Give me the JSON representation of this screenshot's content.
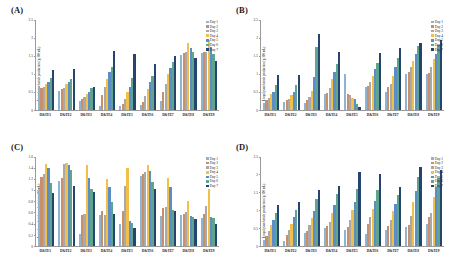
{
  "figure": {
    "panels": [
      "A",
      "B",
      "C",
      "D"
    ]
  },
  "legend": {
    "colors": [
      "#8eb4d4",
      "#c98f6a",
      "#a9a9a9",
      "#f0c04a",
      "#5b8ec4",
      "#5fa48f",
      "#26456e"
    ],
    "items": [
      {
        "label": "Day 1"
      },
      {
        "label": "Day 2"
      },
      {
        "label": "Day 3"
      },
      {
        "label": "Day 4"
      },
      {
        "label": "Day 5"
      },
      {
        "label": "Day 6"
      },
      {
        "label": "Day 7"
      }
    ]
  },
  "chart_data": [
    {
      "panel": "A",
      "type": "bar",
      "title": "(A)",
      "xlabel": "",
      "ylabel": "Exopolysaccharide production (g/100 mL)",
      "ylim": [
        0,
        2.5
      ],
      "yticks": [
        0,
        0.5,
        1,
        1.5,
        2,
        2.5
      ],
      "ytick_labels": [
        "0",
        "0.5",
        "1",
        "1.5",
        "2",
        "2.5"
      ],
      "grid": false,
      "legend_position": "top-right",
      "categories": [
        "D&TE1",
        "D&TE2",
        "D&TE3",
        "D&TE4",
        "D&TE5",
        "D&TE6",
        "D&TE7",
        "D&TE8",
        "D&TE9"
      ],
      "series": [
        {
          "name": "Day 1",
          "values": [
            0.56,
            0.52,
            0.25,
            0.1,
            0.1,
            0.12,
            0.25,
            1.52,
            1.58
          ]
        },
        {
          "name": "Day 2",
          "values": [
            0.6,
            0.56,
            0.3,
            0.4,
            0.15,
            0.2,
            0.5,
            1.58,
            1.6
          ]
        },
        {
          "name": "Day 3",
          "values": [
            0.64,
            0.6,
            0.36,
            0.62,
            0.3,
            0.38,
            0.72,
            1.62,
            1.62
          ]
        },
        {
          "name": "Day 4",
          "values": [
            0.7,
            0.7,
            0.42,
            0.86,
            0.5,
            0.58,
            0.98,
            1.87,
            1.93
          ]
        },
        {
          "name": "Day 5",
          "values": [
            0.78,
            0.76,
            0.5,
            1.05,
            0.62,
            0.76,
            1.15,
            1.72,
            1.74
          ]
        },
        {
          "name": "Day 6",
          "values": [
            0.88,
            0.86,
            0.6,
            1.18,
            0.88,
            0.94,
            1.33,
            1.6,
            1.56
          ]
        },
        {
          "name": "Day 7",
          "values": [
            1.11,
            1.14,
            0.64,
            1.64,
            1.55,
            1.28,
            1.5,
            1.44,
            1.36
          ]
        }
      ]
    },
    {
      "panel": "B",
      "type": "bar",
      "title": "(B)",
      "xlabel": "",
      "ylabel": "Exopolysaccharide production (g/100 mL)",
      "ylim": [
        0,
        2.5
      ],
      "yticks": [
        0,
        0.5,
        1,
        1.5,
        2,
        2.5
      ],
      "ytick_labels": [
        "0",
        "0.5",
        "1",
        "1.5",
        "2",
        "2.5"
      ],
      "grid": false,
      "legend_position": "top-right",
      "categories": [
        "D&TE1",
        "D&TE2",
        "D&TE3",
        "D&TE4",
        "D&TE5",
        "D&TE6",
        "D&TE7",
        "D&TE8",
        "D&TE9"
      ],
      "series": [
        {
          "name": "Day 1",
          "values": [
            0.18,
            0.2,
            0.17,
            0.42,
            0.98,
            0.62,
            0.5,
            0.98,
            0.98
          ]
        },
        {
          "name": "Day 2",
          "values": [
            0.26,
            0.26,
            0.26,
            0.46,
            0.44,
            0.66,
            0.62,
            1.06,
            1.02
          ]
        },
        {
          "name": "Day 3",
          "values": [
            0.32,
            0.3,
            0.36,
            0.6,
            0.4,
            0.78,
            0.72,
            1.2,
            1.18
          ]
        },
        {
          "name": "Day 4",
          "values": [
            0.44,
            0.4,
            0.52,
            0.86,
            0.33,
            0.94,
            0.95,
            1.36,
            1.4
          ]
        },
        {
          "name": "Day 5",
          "values": [
            0.5,
            0.5,
            0.9,
            1.06,
            0.28,
            1.12,
            1.2,
            1.56,
            1.56
          ]
        },
        {
          "name": "Day 6",
          "values": [
            0.68,
            0.68,
            1.76,
            1.28,
            0.15,
            1.3,
            1.44,
            1.78,
            1.8
          ]
        },
        {
          "name": "Day 7",
          "values": [
            0.97,
            0.97,
            2.12,
            1.62,
            0.07,
            1.58,
            1.72,
            1.86,
            1.95
          ]
        }
      ]
    },
    {
      "panel": "C",
      "type": "bar",
      "title": "(C)",
      "xlabel": "",
      "ylabel": "Exopolysaccharide production (g/100 mL)",
      "ylim": [
        0,
        1.6
      ],
      "yticks": [
        0,
        0.2,
        0.4,
        0.6,
        0.8,
        1,
        1.2,
        1.4,
        1.6
      ],
      "ytick_labels": [
        "0",
        "0.2",
        "0.4",
        "0.6",
        "0.8",
        "1",
        "1.2",
        "1.4",
        "1.6"
      ],
      "grid": false,
      "legend_position": "top-right",
      "categories": [
        "D&TE1",
        "D&TE2",
        "D&TE3",
        "D&TE4",
        "D&TE5",
        "D&TE6",
        "D&TE7",
        "D&TE8",
        "D&TE9"
      ],
      "series": [
        {
          "name": "Day 1",
          "values": [
            1.02,
            1.17,
            0.22,
            0.56,
            0.4,
            1.25,
            0.54,
            0.56,
            0.5
          ]
        },
        {
          "name": "Day 2",
          "values": [
            1.23,
            1.22,
            0.56,
            0.62,
            0.62,
            1.28,
            0.68,
            0.58,
            0.58
          ]
        },
        {
          "name": "Day 3",
          "values": [
            1.28,
            1.46,
            0.58,
            0.56,
            1.07,
            1.33,
            0.7,
            0.6,
            0.72
          ]
        },
        {
          "name": "Day 4",
          "values": [
            1.46,
            1.49,
            1.44,
            1.2,
            1.4,
            1.45,
            1.22,
            0.8,
            1.02
          ]
        },
        {
          "name": "Day 5",
          "values": [
            1.4,
            1.45,
            1.22,
            1.06,
            0.45,
            1.34,
            1.06,
            0.54,
            0.52
          ]
        },
        {
          "name": "Day 6",
          "values": [
            1.12,
            1.35,
            1.02,
            0.78,
            0.42,
            1.15,
            0.64,
            0.52,
            0.5
          ]
        },
        {
          "name": "Day 7",
          "values": [
            0.94,
            1.08,
            0.96,
            0.58,
            0.32,
            1.02,
            0.62,
            0.48,
            0.4
          ]
        }
      ]
    },
    {
      "panel": "D",
      "type": "bar",
      "title": "(D)",
      "xlabel": "",
      "ylabel": "Exopolysaccharide production (g/100 mL)",
      "ylim": [
        0,
        2.5
      ],
      "yticks": [
        0,
        0.5,
        1,
        1.5,
        2,
        2.5
      ],
      "ytick_labels": [
        "0",
        "0.5",
        "1",
        "1.5",
        "2",
        "2.5"
      ],
      "grid": false,
      "legend_position": "top-right",
      "categories": [
        "D&TE1",
        "D&TE2",
        "D&TE3",
        "D&TE4",
        "D&TE5",
        "D&TE6",
        "D&TE7",
        "D&TE8",
        "D&TE9"
      ],
      "series": [
        {
          "name": "Day 1",
          "values": [
            0.16,
            0.14,
            0.35,
            0.5,
            0.45,
            0.33,
            0.46,
            0.52,
            0.62
          ]
        },
        {
          "name": "Day 2",
          "values": [
            0.28,
            0.3,
            0.42,
            0.55,
            0.52,
            0.62,
            0.56,
            0.6,
            0.82
          ]
        },
        {
          "name": "Day 3",
          "values": [
            0.42,
            0.44,
            0.58,
            0.68,
            0.72,
            0.8,
            0.72,
            0.84,
            0.92
          ]
        },
        {
          "name": "Day 4",
          "values": [
            0.58,
            0.62,
            0.78,
            0.92,
            1.0,
            1.04,
            0.98,
            1.22,
            1.38
          ]
        },
        {
          "name": "Day 5",
          "values": [
            0.72,
            0.8,
            0.98,
            1.14,
            1.24,
            1.26,
            1.18,
            1.54,
            1.66
          ]
        },
        {
          "name": "Day 6",
          "values": [
            0.92,
            1.0,
            1.3,
            1.44,
            1.58,
            1.56,
            1.42,
            1.92,
            1.9
          ]
        },
        {
          "name": "Day 7",
          "values": [
            1.14,
            1.22,
            1.56,
            1.68,
            2.06,
            2.0,
            1.64,
            2.2,
            2.12
          ]
        }
      ]
    }
  ]
}
